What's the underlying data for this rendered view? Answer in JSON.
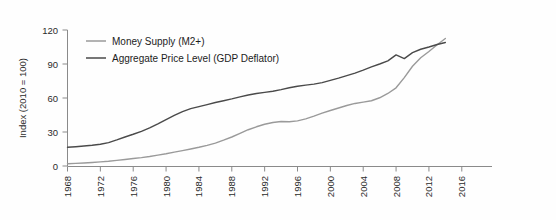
{
  "chart_data": {
    "type": "line",
    "title": "",
    "xlabel": "",
    "ylabel": "Index (2010 = 100)",
    "xlim": [
      1968,
      2017
    ],
    "ylim": [
      0,
      120
    ],
    "xticks": [
      1968,
      1972,
      1976,
      1980,
      1984,
      1988,
      1992,
      1996,
      2000,
      2004,
      2008,
      2012,
      2016
    ],
    "yticks": [
      0,
      30,
      60,
      90,
      120
    ],
    "grid": false,
    "legend_position": "top-left-inside",
    "series": [
      {
        "name": "Money Supply (M2+)",
        "color": "#9a9a9a",
        "x": [
          1968,
          1969,
          1970,
          1971,
          1972,
          1973,
          1974,
          1975,
          1976,
          1977,
          1978,
          1979,
          1980,
          1981,
          1982,
          1983,
          1984,
          1985,
          1986,
          1987,
          1988,
          1989,
          1990,
          1991,
          1992,
          1993,
          1994,
          1995,
          1996,
          1997,
          1998,
          1999,
          2000,
          2001,
          2002,
          2003,
          2004,
          2005,
          2006,
          2007,
          2008,
          2009,
          2010,
          2011,
          2012,
          2013,
          2014
        ],
        "values": [
          2.0,
          2.3,
          2.7,
          3.1,
          3.6,
          4.2,
          5.0,
          5.8,
          6.6,
          7.4,
          8.4,
          9.6,
          10.8,
          12.2,
          13.6,
          15.0,
          16.5,
          18.2,
          20.2,
          22.8,
          25.6,
          28.8,
          32.0,
          34.6,
          36.8,
          38.4,
          39.2,
          39.0,
          39.8,
          41.6,
          44.0,
          46.6,
          49.0,
          51.2,
          53.4,
          55.2,
          56.4,
          57.6,
          60.2,
          64.0,
          69.0,
          78.0,
          88.0,
          95.5,
          101.0,
          107.0,
          112.5
        ]
      },
      {
        "name": "Aggregate Price Level (GDP Deflator)",
        "color": "#4a4a4a",
        "x": [
          1968,
          1969,
          1970,
          1971,
          1972,
          1973,
          1974,
          1975,
          1976,
          1977,
          1978,
          1979,
          1980,
          1981,
          1982,
          1983,
          1984,
          1985,
          1986,
          1987,
          1988,
          1989,
          1990,
          1991,
          1992,
          1993,
          1994,
          1995,
          1996,
          1997,
          1998,
          1999,
          2000,
          2001,
          2002,
          2003,
          2004,
          2005,
          2006,
          2007,
          2008,
          2009,
          2010,
          2011,
          2012,
          2013,
          2014
        ],
        "values": [
          16.5,
          17.0,
          17.6,
          18.3,
          19.2,
          20.6,
          23.0,
          25.6,
          28.0,
          30.6,
          33.6,
          37.2,
          41.0,
          44.6,
          48.0,
          50.6,
          52.4,
          54.2,
          56.0,
          57.6,
          59.2,
          61.0,
          62.6,
          64.0,
          65.0,
          66.0,
          67.4,
          69.0,
          70.4,
          71.4,
          72.2,
          73.6,
          75.6,
          77.6,
          79.8,
          82.0,
          84.6,
          87.4,
          90.0,
          92.8,
          98.0,
          94.8,
          100.0,
          103.0,
          105.0,
          107.2,
          109.0
        ]
      }
    ],
    "legend": [
      {
        "label": "Money Supply (M2+)",
        "color": "#9a9a9a"
      },
      {
        "label": "Aggregate Price Level (GDP Deflator)",
        "color": "#4a4a4a"
      }
    ]
  }
}
